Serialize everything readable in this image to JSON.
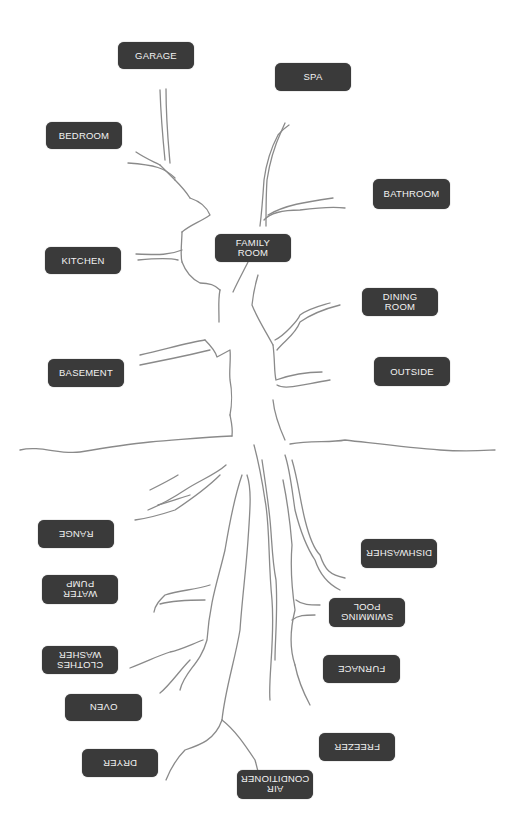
{
  "diagram": {
    "type": "tree-with-labeled-branches-and-roots",
    "colors": {
      "label_bg": "#3a3a3a",
      "label_text": "#f2f2f2",
      "line": "#8a8a8a",
      "background": "#ffffff"
    },
    "branches": [
      {
        "id": "garage",
        "text": "GARAGE",
        "x": 118,
        "y": 42,
        "w": 76,
        "h": 27
      },
      {
        "id": "spa",
        "text": "SPA",
        "x": 275,
        "y": 63,
        "w": 76,
        "h": 28
      },
      {
        "id": "bedroom",
        "text": "BEDROOM",
        "x": 46,
        "y": 122,
        "w": 76,
        "h": 27
      },
      {
        "id": "bathroom",
        "text": "BATHROOM",
        "x": 373,
        "y": 179,
        "w": 77,
        "h": 30
      },
      {
        "id": "family-room",
        "text": "FAMILY\nROOM",
        "x": 215,
        "y": 234,
        "w": 76,
        "h": 28
      },
      {
        "id": "kitchen",
        "text": "KITCHEN",
        "x": 45,
        "y": 247,
        "w": 76,
        "h": 27
      },
      {
        "id": "dining-room",
        "text": "DINING\nROOM",
        "x": 362,
        "y": 288,
        "w": 76,
        "h": 28
      },
      {
        "id": "basement",
        "text": "BASEMENT",
        "x": 48,
        "y": 359,
        "w": 76,
        "h": 28
      },
      {
        "id": "outside",
        "text": "OUTSIDE",
        "x": 374,
        "y": 357,
        "w": 76,
        "h": 29
      }
    ],
    "roots": [
      {
        "id": "range",
        "text": "RANGE",
        "x": 38,
        "y": 520,
        "w": 76,
        "h": 28
      },
      {
        "id": "dishwasher",
        "text": "DISHWASHER",
        "x": 361,
        "y": 539,
        "w": 76,
        "h": 29
      },
      {
        "id": "water-pump",
        "text": "WATER\nPUMP",
        "x": 42,
        "y": 575,
        "w": 76,
        "h": 29
      },
      {
        "id": "swimming-pool",
        "text": "SWIMMING\nPOOL",
        "x": 329,
        "y": 598,
        "w": 76,
        "h": 29
      },
      {
        "id": "clothes-washer",
        "text": "CLOTHES\nWASHER",
        "x": 42,
        "y": 646,
        "w": 76,
        "h": 28
      },
      {
        "id": "furnace",
        "text": "FURNACE",
        "x": 323,
        "y": 655,
        "w": 77,
        "h": 28
      },
      {
        "id": "oven",
        "text": "OVEN",
        "x": 65,
        "y": 694,
        "w": 77,
        "h": 27
      },
      {
        "id": "freezer",
        "text": "FREEZER",
        "x": 319,
        "y": 733,
        "w": 76,
        "h": 28
      },
      {
        "id": "dryer",
        "text": "DRYER",
        "x": 82,
        "y": 749,
        "w": 76,
        "h": 28
      },
      {
        "id": "air-conditioner",
        "text": "AIR\nCONDITIONER",
        "x": 237,
        "y": 770,
        "w": 76,
        "h": 29
      }
    ]
  }
}
